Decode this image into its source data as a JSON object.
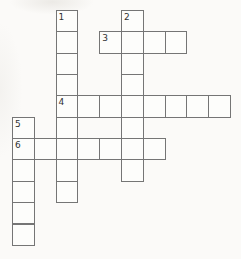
{
  "page": {
    "background_color": "#fbfaf8"
  },
  "puzzle": {
    "kind": "crossword-grid",
    "grid": {
      "origin_x": 12,
      "origin_y": 10,
      "cell_width": 21.8,
      "cell_height": 21.35,
      "columns": 10,
      "rows": 11,
      "border_color": "#757575",
      "cell_fill": "#fdfdfb",
      "number_color": "#323232"
    },
    "entries": [
      {
        "number": "1",
        "direction": "down",
        "col": 2,
        "row": 0,
        "length": 9
      },
      {
        "number": "2",
        "direction": "down",
        "col": 5,
        "row": 0,
        "length": 8
      },
      {
        "number": "3",
        "direction": "across",
        "col": 4,
        "row": 1,
        "length": 4
      },
      {
        "number": "4",
        "direction": "across",
        "col": 2,
        "row": 4,
        "length": 8
      },
      {
        "number": "5",
        "direction": "down",
        "col": 0,
        "row": 5,
        "length": 6
      },
      {
        "number": "6",
        "direction": "across",
        "col": 0,
        "row": 6,
        "length": 7
      }
    ]
  }
}
